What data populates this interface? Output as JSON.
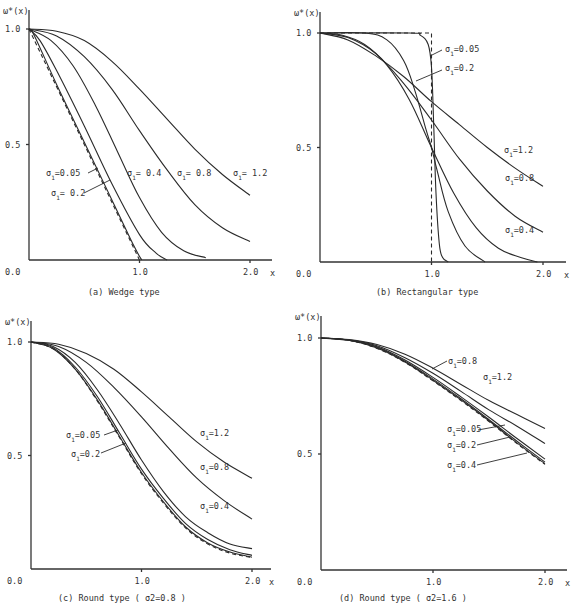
{
  "chart_data": [
    {
      "id": "a",
      "type": "line",
      "title": "(a)    Wedge type",
      "ylabel": "ω*(x)",
      "xlabel": "x",
      "xlim": [
        0,
        2.2
      ],
      "ylim": [
        0,
        1.0
      ],
      "xticks": [
        "0.0",
        "1.0",
        "2.0"
      ],
      "yticks": [
        "0.5",
        "1.0"
      ],
      "grid": false,
      "frame": {
        "x0": 29,
        "x2": 250,
        "y0": 260,
        "y1": 29,
        "xaxis_end": 272,
        "yaxis_top": 10
      },
      "series": [
        {
          "name": "ideal",
          "style": "dashed",
          "x": [
            0,
            0.25,
            0.5,
            0.75,
            1.0
          ],
          "y": [
            1.0,
            0.75,
            0.5,
            0.25,
            0.0
          ]
        },
        {
          "name": "σ1=0.05",
          "x": [
            0,
            0.05,
            0.25,
            0.5,
            0.75,
            0.95,
            1.02
          ],
          "y": [
            1.0,
            0.97,
            0.76,
            0.51,
            0.26,
            0.06,
            0.0
          ]
        },
        {
          "name": "σ1=0.2",
          "x": [
            0,
            0.1,
            0.25,
            0.5,
            0.75,
            1.0,
            1.15,
            1.25
          ],
          "y": [
            1.0,
            0.95,
            0.82,
            0.58,
            0.33,
            0.11,
            0.03,
            0.0
          ]
        },
        {
          "name": "σ1=0.4",
          "x": [
            0,
            0.2,
            0.4,
            0.6,
            0.8,
            1.0,
            1.2,
            1.4,
            1.6
          ],
          "y": [
            1.0,
            0.95,
            0.84,
            0.67,
            0.47,
            0.27,
            0.12,
            0.04,
            0.01
          ]
        },
        {
          "name": "σ1=0.8",
          "x": [
            0,
            0.25,
            0.5,
            0.75,
            1.0,
            1.25,
            1.5,
            1.75,
            2.0
          ],
          "y": [
            1.0,
            0.97,
            0.88,
            0.74,
            0.56,
            0.39,
            0.24,
            0.14,
            0.08
          ]
        },
        {
          "name": "σ1=1.2",
          "x": [
            0,
            0.25,
            0.5,
            0.75,
            1.0,
            1.25,
            1.5,
            1.75,
            2.0
          ],
          "y": [
            1.0,
            0.99,
            0.95,
            0.86,
            0.74,
            0.61,
            0.48,
            0.37,
            0.28
          ]
        }
      ],
      "annotations": [
        {
          "text": "σ",
          "sub": "1",
          "rest": "=0.05",
          "x": 46,
          "y": 176,
          "lead": [
            [
              88,
              173
            ],
            [
              98,
              168
            ]
          ]
        },
        {
          "text": "σ",
          "sub": "1",
          "rest": "= 0.2",
          "x": 51,
          "y": 196,
          "lead": [
            [
              84,
              193
            ],
            [
              110,
              180
            ]
          ]
        },
        {
          "text": "σ",
          "sub": "1",
          "rest": "= 0.4",
          "x": 127,
          "y": 176
        },
        {
          "text": "σ",
          "sub": "1",
          "rest": "= 0.8",
          "x": 177,
          "y": 176
        },
        {
          "text": "σ",
          "sub": "1",
          "rest": "= 1.2",
          "x": 233,
          "y": 176
        }
      ],
      "caption_pos": [
        88,
        295
      ]
    },
    {
      "id": "b",
      "type": "line",
      "title": "(b)     Rectangular type",
      "ylabel": "ω*(x)",
      "xlabel": "x",
      "xlim": [
        0,
        2.2
      ],
      "ylim": [
        0,
        1.0
      ],
      "xticks": [
        "0.0",
        "1.0",
        "2.0"
      ],
      "yticks": [
        "0.5",
        "1.0"
      ],
      "grid": false,
      "frame": {
        "x0": 320,
        "x2": 543,
        "y0": 262,
        "y1": 33,
        "xaxis_end": 566,
        "yaxis_top": 12
      },
      "series": [
        {
          "name": "ideal",
          "style": "dashed",
          "x": [
            0,
            1.0,
            1.0
          ],
          "y": [
            1.0,
            1.0,
            0.0
          ]
        },
        {
          "name": "σ1=0.05",
          "x": [
            0,
            0.8,
            0.9,
            0.97,
            1.0,
            1.02,
            1.04,
            1.07,
            1.1,
            1.15
          ],
          "y": [
            1.0,
            1.0,
            0.99,
            0.95,
            0.85,
            0.6,
            0.3,
            0.08,
            0.02,
            0.0
          ]
        },
        {
          "name": "σ1=0.2",
          "x": [
            0,
            0.4,
            0.6,
            0.75,
            0.85,
            0.95,
            1.0,
            1.05,
            1.15,
            1.3,
            1.48
          ],
          "y": [
            1.0,
            1.0,
            0.97,
            0.88,
            0.75,
            0.58,
            0.5,
            0.4,
            0.22,
            0.07,
            0.0
          ]
        },
        {
          "name": "σ1=0.4",
          "x": [
            0,
            0.2,
            0.4,
            0.6,
            0.8,
            1.0,
            1.2,
            1.4,
            1.6,
            1.8,
            1.95
          ],
          "y": [
            1.0,
            0.99,
            0.95,
            0.86,
            0.71,
            0.5,
            0.3,
            0.15,
            0.06,
            0.02,
            0.0
          ]
        },
        {
          "name": "σ1=0.8",
          "x": [
            0,
            0.25,
            0.5,
            0.75,
            1.0,
            1.25,
            1.5,
            1.75,
            2.0
          ],
          "y": [
            1.0,
            0.98,
            0.91,
            0.78,
            0.62,
            0.45,
            0.31,
            0.2,
            0.13
          ]
        },
        {
          "name": "σ1=1.2",
          "x": [
            0,
            0.25,
            0.5,
            0.75,
            1.0,
            1.25,
            1.5,
            1.75,
            2.0
          ],
          "y": [
            1.0,
            0.97,
            0.9,
            0.81,
            0.7,
            0.6,
            0.5,
            0.41,
            0.33
          ]
        }
      ],
      "annotations": [
        {
          "text": "σ",
          "sub": "1",
          "rest": "=0.05",
          "x": 445,
          "y": 52,
          "lead": [
            [
              442,
              50
            ],
            [
              430,
              56
            ]
          ]
        },
        {
          "text": "σ",
          "sub": "1",
          "rest": "=0.2",
          "x": 445,
          "y": 71,
          "lead": [
            [
              442,
              70
            ],
            [
              416,
              81
            ]
          ]
        },
        {
          "text": "σ",
          "sub": "1",
          "rest": "=1.2",
          "x": 504,
          "y": 153
        },
        {
          "text": "σ",
          "sub": "1",
          "rest": "=0.8",
          "x": 505,
          "y": 181
        },
        {
          "text": "σ",
          "sub": "1",
          "rest": "=0.4",
          "x": 505,
          "y": 233
        }
      ],
      "caption_pos": [
        376,
        295
      ]
    },
    {
      "id": "c",
      "type": "line",
      "title": "(c) Round type ( σ2=0.8 )",
      "ylabel": "ω*(x)",
      "xlabel": "x",
      "xlim": [
        0,
        2.2
      ],
      "ylim": [
        0,
        1.0
      ],
      "xticks": [
        "0.0",
        "1.0",
        "2.0"
      ],
      "yticks": [
        "0.5",
        "1.0"
      ],
      "grid": false,
      "frame": {
        "x0": 31,
        "x2": 252,
        "y0": 569,
        "y1": 342,
        "xaxis_end": 271,
        "yaxis_top": 321
      },
      "series": [
        {
          "name": "ideal",
          "style": "dashed",
          "x": [
            0,
            0.2,
            0.4,
            0.6,
            0.8,
            1.0,
            1.2,
            1.4,
            1.6,
            1.8,
            2.0
          ],
          "y": [
            1.0,
            0.97,
            0.88,
            0.74,
            0.58,
            0.42,
            0.29,
            0.18,
            0.11,
            0.07,
            0.05
          ]
        },
        {
          "name": "σ1=0.05",
          "x": [
            0,
            0.2,
            0.4,
            0.6,
            0.8,
            1.0,
            1.2,
            1.4,
            1.6,
            1.8,
            2.0
          ],
          "y": [
            1.0,
            0.97,
            0.88,
            0.745,
            0.585,
            0.425,
            0.295,
            0.185,
            0.115,
            0.075,
            0.052
          ]
        },
        {
          "name": "σ1=0.2",
          "x": [
            0,
            0.2,
            0.4,
            0.6,
            0.8,
            1.0,
            1.2,
            1.4,
            1.6,
            1.8,
            2.0
          ],
          "y": [
            1.0,
            0.975,
            0.89,
            0.76,
            0.6,
            0.44,
            0.31,
            0.2,
            0.13,
            0.085,
            0.06
          ]
        },
        {
          "name": "σ1=0.4",
          "x": [
            0,
            0.2,
            0.4,
            0.6,
            0.8,
            1.0,
            1.2,
            1.4,
            1.6,
            1.8,
            2.0
          ],
          "y": [
            1.0,
            0.98,
            0.91,
            0.79,
            0.64,
            0.48,
            0.34,
            0.23,
            0.16,
            0.11,
            0.09
          ]
        },
        {
          "name": "σ1=0.8",
          "x": [
            0,
            0.25,
            0.5,
            0.75,
            1.0,
            1.25,
            1.5,
            1.75,
            2.0
          ],
          "y": [
            1.0,
            0.98,
            0.91,
            0.8,
            0.67,
            0.53,
            0.4,
            0.3,
            0.22
          ]
        },
        {
          "name": "σ1=1.2",
          "x": [
            0,
            0.25,
            0.5,
            0.75,
            1.0,
            1.25,
            1.5,
            1.75,
            2.0
          ],
          "y": [
            1.0,
            0.99,
            0.95,
            0.88,
            0.78,
            0.67,
            0.56,
            0.47,
            0.4
          ]
        }
      ],
      "annotations": [
        {
          "text": "σ",
          "sub": "1",
          "rest": "=0.05",
          "x": 66,
          "y": 438,
          "lead": [
            [
              104,
              435
            ],
            [
              118,
              430
            ]
          ]
        },
        {
          "text": "σ",
          "sub": "1",
          "rest": "=0.2",
          "x": 71,
          "y": 457,
          "lead": [
            [
              101,
              453
            ],
            [
              126,
              443
            ]
          ]
        },
        {
          "text": "σ",
          "sub": "1",
          "rest": "=1.2",
          "x": 200,
          "y": 436
        },
        {
          "text": "σ",
          "sub": "1",
          "rest": "=0.8",
          "x": 200,
          "y": 470
        },
        {
          "text": "σ",
          "sub": "1",
          "rest": "=0.4",
          "x": 200,
          "y": 509
        }
      ],
      "caption_pos": [
        58,
        601
      ]
    },
    {
      "id": "d",
      "type": "line",
      "title": "(d) Round type ( σ2=1.6 )",
      "ylabel": "ω*(x)",
      "xlabel": "x",
      "xlim": [
        0,
        2.2
      ],
      "ylim": [
        0,
        1.0
      ],
      "xticks": [
        "0.0",
        "1.0",
        "2.0"
      ],
      "yticks": [
        "0.5",
        "1.0"
      ],
      "grid": false,
      "frame": {
        "x0": 321,
        "x2": 545,
        "y0": 570,
        "y1": 338,
        "xaxis_end": 567,
        "yaxis_top": 316
      },
      "series": [
        {
          "name": "ideal",
          "style": "dashed",
          "x": [
            0,
            0.25,
            0.5,
            0.75,
            1.0,
            1.25,
            1.5,
            1.75,
            2.0
          ],
          "y": [
            1.0,
            0.99,
            0.955,
            0.895,
            0.815,
            0.73,
            0.64,
            0.545,
            0.455
          ]
        },
        {
          "name": "σ1=0.05",
          "x": [
            0,
            0.25,
            0.5,
            0.75,
            1.0,
            1.25,
            1.5,
            1.75,
            2.0
          ],
          "y": [
            1.0,
            0.99,
            0.957,
            0.897,
            0.818,
            0.733,
            0.643,
            0.548,
            0.458
          ]
        },
        {
          "name": "σ1=0.2",
          "x": [
            0,
            0.25,
            0.5,
            0.75,
            1.0,
            1.25,
            1.5,
            1.75,
            2.0
          ],
          "y": [
            1.0,
            0.99,
            0.96,
            0.9,
            0.823,
            0.738,
            0.648,
            0.555,
            0.465
          ]
        },
        {
          "name": "σ1=0.4",
          "x": [
            0,
            0.25,
            0.5,
            0.75,
            1.0,
            1.25,
            1.5,
            1.75,
            2.0
          ],
          "y": [
            1.0,
            0.99,
            0.962,
            0.905,
            0.83,
            0.746,
            0.658,
            0.567,
            0.478
          ]
        },
        {
          "name": "σ1=0.8",
          "x": [
            0,
            0.25,
            0.5,
            0.75,
            1.0,
            1.25,
            1.5,
            1.75,
            2.0
          ],
          "y": [
            1.0,
            0.992,
            0.967,
            0.915,
            0.848,
            0.77,
            0.69,
            0.62,
            0.545
          ]
        },
        {
          "name": "σ1=1.2",
          "x": [
            0,
            0.25,
            0.5,
            0.75,
            1.0,
            1.25,
            1.5,
            1.75,
            2.0
          ],
          "y": [
            1.0,
            0.993,
            0.972,
            0.93,
            0.87,
            0.8,
            0.73,
            0.67,
            0.61
          ]
        }
      ],
      "annotations": [
        {
          "text": "σ",
          "sub": "1",
          "rest": "=0.8",
          "x": 448,
          "y": 364,
          "lead": [
            [
              447,
              361
            ],
            [
              432,
              369
            ]
          ]
        },
        {
          "text": "σ",
          "sub": "1",
          "rest": "=1.2",
          "x": 483,
          "y": 380
        },
        {
          "text": "σ",
          "sub": "1",
          "rest": "=0.05",
          "x": 447,
          "y": 432,
          "lead": [
            [
              478,
              430
            ],
            [
              505,
              425
            ]
          ]
        },
        {
          "text": "σ",
          "sub": "1",
          "rest": "=0.2",
          "x": 447,
          "y": 448,
          "lead": [
            [
              477,
              445
            ],
            [
              510,
              437
            ]
          ]
        },
        {
          "text": "σ",
          "sub": "1",
          "rest": "=0.4",
          "x": 447,
          "y": 468,
          "lead": [
            [
              477,
              465
            ],
            [
              527,
              453
            ]
          ]
        }
      ],
      "caption_pos": [
        339,
        601
      ]
    }
  ]
}
